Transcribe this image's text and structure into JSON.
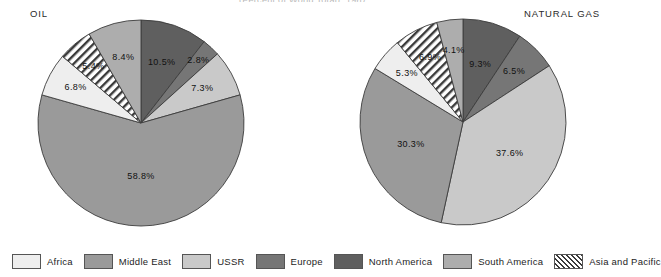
{
  "figure": {
    "title": "(Percent of World Total), 1987"
  },
  "legend": {
    "items": [
      {
        "label": "Africa",
        "color": "#eeeeee",
        "hatch": false
      },
      {
        "label": "Middle East",
        "color": "#9a9a9a",
        "hatch": false
      },
      {
        "label": "USSR",
        "color": "#c9c9c9",
        "hatch": false
      },
      {
        "label": "Europe",
        "color": "#767676",
        "hatch": false
      },
      {
        "label": "North America",
        "color": "#5f5f5f",
        "hatch": false
      },
      {
        "label": "South America",
        "color": "#adadad",
        "hatch": false
      },
      {
        "label": "Asia and Pacific",
        "color": "#ffffff",
        "hatch": true
      }
    ]
  },
  "chart_data": [
    {
      "type": "pie",
      "title": "OIL",
      "units": "percent of world total",
      "center": [
        141,
        123
      ],
      "radius": 103,
      "start_angle_deg": 0,
      "direction": "clockwise",
      "categories": [
        "North America",
        "Europe",
        "USSR",
        "Middle East",
        "Africa",
        "Asia and Pacific",
        "South America"
      ],
      "values": [
        10.5,
        2.8,
        7.3,
        58.8,
        6.8,
        5.4,
        8.4
      ],
      "labels": [
        "10.5%",
        "2.8%",
        "7.3%",
        "58.8%",
        "6.8%",
        "5.4%",
        "8.4%"
      ],
      "colors": [
        "#5f5f5f",
        "#767676",
        "#c9c9c9",
        "#9a9a9a",
        "#eeeeee",
        "#ffffff",
        "#adadad"
      ],
      "hatched": [
        false,
        false,
        false,
        false,
        false,
        true,
        false
      ],
      "label_radius_frac": [
        0.62,
        0.82,
        0.68,
        0.52,
        0.72,
        0.72,
        0.66
      ]
    },
    {
      "type": "pie",
      "title": "NATURAL GAS",
      "units": "percent of world total",
      "center": [
        463,
        122
      ],
      "radius": 103,
      "start_angle_deg": 0,
      "direction": "clockwise",
      "categories": [
        "North America",
        "Europe",
        "USSR",
        "Middle East",
        "Africa",
        "Asia and Pacific",
        "South America"
      ],
      "values": [
        9.3,
        6.5,
        37.6,
        30.3,
        5.3,
        6.9,
        4.1
      ],
      "labels": [
        "9.3%",
        "6.5%",
        "37.6%",
        "30.3%",
        "5.3%",
        "6.9%",
        "4.1%"
      ],
      "colors": [
        "#5f5f5f",
        "#767676",
        "#c9c9c9",
        "#9a9a9a",
        "#eeeeee",
        "#ffffff",
        "#adadad"
      ],
      "hatched": [
        false,
        false,
        false,
        false,
        false,
        true,
        false
      ],
      "label_radius_frac": [
        0.58,
        0.7,
        0.55,
        0.55,
        0.72,
        0.7,
        0.7
      ]
    }
  ]
}
